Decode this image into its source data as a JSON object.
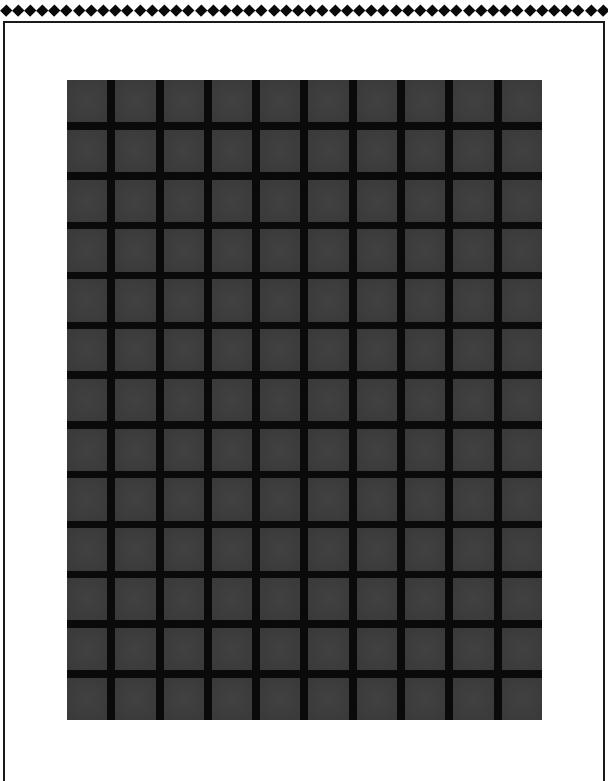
{
  "border": {
    "diamond_count": 50,
    "diamond_color": "#0a0a0a",
    "frame_color": "#1a1a1a"
  },
  "grid": {
    "columns": 10,
    "rows": 13,
    "cell_color": "#3c3c3c",
    "line_color": "#0a0a0a",
    "background": "#ffffff"
  }
}
